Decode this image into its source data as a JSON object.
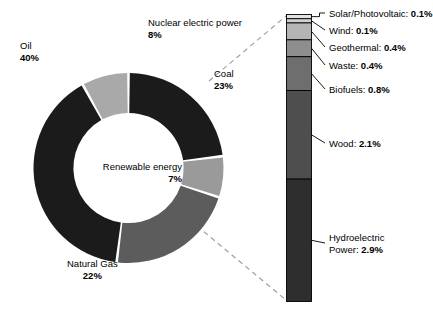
{
  "chart_data": {
    "type": "pie",
    "title": "",
    "subtitle": "",
    "xlabel": "",
    "ylabel": "",
    "legend_position": "none",
    "grid": false,
    "donut": {
      "type": "pie",
      "hole_ratio": 0.58,
      "start_angle_deg": 0,
      "direction": "clockwise",
      "unit": "%",
      "categories": [
        "Oil",
        "Natural Gas",
        "Renewable energy",
        "Coal",
        "Nuclear electric power"
      ],
      "values": [
        40,
        22,
        7,
        23,
        8
      ],
      "slices": [
        {
          "label": "Oil",
          "value": 40,
          "value_text": "40%",
          "color": "#1b1b1b",
          "label_position": "outside-left"
        },
        {
          "label": "Natural Gas",
          "value": 22,
          "value_text": "22%",
          "color": "#5c5c5c",
          "label_position": "outside-bottom"
        },
        {
          "label": "Renewable energy",
          "value": 7,
          "value_text": "7%",
          "color": "#9a9a9a",
          "label_position": "inside-center"
        },
        {
          "label": "Coal",
          "value": 23,
          "value_text": "23%",
          "color": "#1b1b1b",
          "label_position": "outside-right"
        },
        {
          "label": "Nuclear electric power",
          "value": 8,
          "value_text": "8%",
          "color": "#a9a9a9",
          "label_position": "outside-top"
        }
      ]
    },
    "breakout_bar": {
      "type": "bar",
      "orientation": "vertical-stacked",
      "source_slice": "Renewable energy",
      "total": 7.0,
      "unit": "%",
      "categories": [
        "Solar/Photovoltaic",
        "Wind",
        "Geothermal",
        "Waste",
        "Biofuels",
        "Wood",
        "Hydroelectric Power"
      ],
      "values": [
        0.1,
        0.1,
        0.4,
        0.4,
        0.8,
        2.1,
        2.9
      ],
      "segments": [
        {
          "label": "Solar/Photovoltaic",
          "value": 0.1,
          "value_text": "0.1%",
          "color": "#e2e2e2"
        },
        {
          "label": "Wind",
          "value": 0.1,
          "value_text": "0.1%",
          "color": "#cfcfcf"
        },
        {
          "label": "Geothermal",
          "value": 0.4,
          "value_text": "0.4%",
          "color": "#b4b4b4"
        },
        {
          "label": "Waste",
          "value": 0.4,
          "value_text": "0.4%",
          "color": "#8e8e8e"
        },
        {
          "label": "Biofuels",
          "value": 0.8,
          "value_text": "0.8%",
          "color": "#6e6e6e"
        },
        {
          "label": "Wood",
          "value": 2.1,
          "value_text": "2.1%",
          "color": "#4e4e4e"
        },
        {
          "label": "Hydroelectric Power",
          "value": 2.9,
          "value_text": "2.9%",
          "color": "#2e2e2e"
        }
      ]
    }
  },
  "donut_labels": {
    "oil": {
      "name": "Oil",
      "pct": "40%"
    },
    "natural_gas": {
      "name": "Natural Gas",
      "pct": "22%"
    },
    "renewable": {
      "name": "Renewable energy",
      "pct": "7%"
    },
    "coal": {
      "name": "Coal",
      "pct": "23%"
    },
    "nuclear": {
      "name": "Nuclear electric power",
      "pct": "8%"
    }
  },
  "bar_labels": {
    "solar": {
      "name": "Solar/Photovoltaic:",
      "pct": "0.1%"
    },
    "wind": {
      "name": "Wind:",
      "pct": "0.1%"
    },
    "geothermal": {
      "name": "Geothermal:",
      "pct": "0.4%"
    },
    "waste": {
      "name": "Waste:",
      "pct": "0.4%"
    },
    "biofuels": {
      "name": "Biofuels:",
      "pct": "0.8%"
    },
    "wood": {
      "name": "Wood:",
      "pct": "2.1%"
    },
    "hydro": {
      "name": "Hydroelectric",
      "name2": "Power:",
      "pct": "2.9%"
    }
  },
  "colors": {
    "background": "#ffffff",
    "oil": "#1b1b1b",
    "coal": "#1b1b1b",
    "natural_gas": "#5c5c5c",
    "nuclear": "#a9a9a9",
    "renewable": "#9a9a9a",
    "leader_line": "#000000",
    "callout_dash": "#9d9d9d",
    "bar_border": "#000000"
  }
}
